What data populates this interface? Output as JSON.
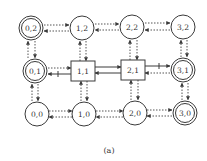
{
  "diagram": {
    "caption": "(a)",
    "colors": {
      "stroke": "#3a3a3a",
      "dotted": "#555555",
      "text": "#333333"
    },
    "nodes": [
      {
        "id": "0,2",
        "label": "0,2",
        "shape": "double-circle",
        "x": 31,
        "y": 28
      },
      {
        "id": "1,2",
        "label": "1,2",
        "shape": "circle",
        "x": 82,
        "y": 28
      },
      {
        "id": "2,2",
        "label": "2,2",
        "shape": "circle",
        "x": 132,
        "y": 27
      },
      {
        "id": "3,2",
        "label": "3,2",
        "shape": "circle",
        "x": 183,
        "y": 27
      },
      {
        "id": "0,1",
        "label": "0,1",
        "shape": "double-circle",
        "x": 35,
        "y": 71
      },
      {
        "id": "1,1",
        "label": "1,1",
        "shape": "box",
        "x": 83,
        "y": 71
      },
      {
        "id": "2,1",
        "label": "2,1",
        "shape": "box",
        "x": 133,
        "y": 70
      },
      {
        "id": "3,1",
        "label": "3,1",
        "shape": "double-circle",
        "x": 183,
        "y": 70
      },
      {
        "id": "0,0",
        "label": "0,0",
        "shape": "circle",
        "x": 37,
        "y": 114
      },
      {
        "id": "1,0",
        "label": "1,0",
        "shape": "circle",
        "x": 84,
        "y": 114
      },
      {
        "id": "2,0",
        "label": "2,0",
        "shape": "circle",
        "x": 135,
        "y": 113
      },
      {
        "id": "3,0",
        "label": "3,0",
        "shape": "double-circle",
        "x": 185,
        "y": 113
      }
    ],
    "edges_note": "Dotted bidirectional arrows between grid-adjacent states; solid arrows (with tick marks) on row 1 between boxes and outer states."
  }
}
